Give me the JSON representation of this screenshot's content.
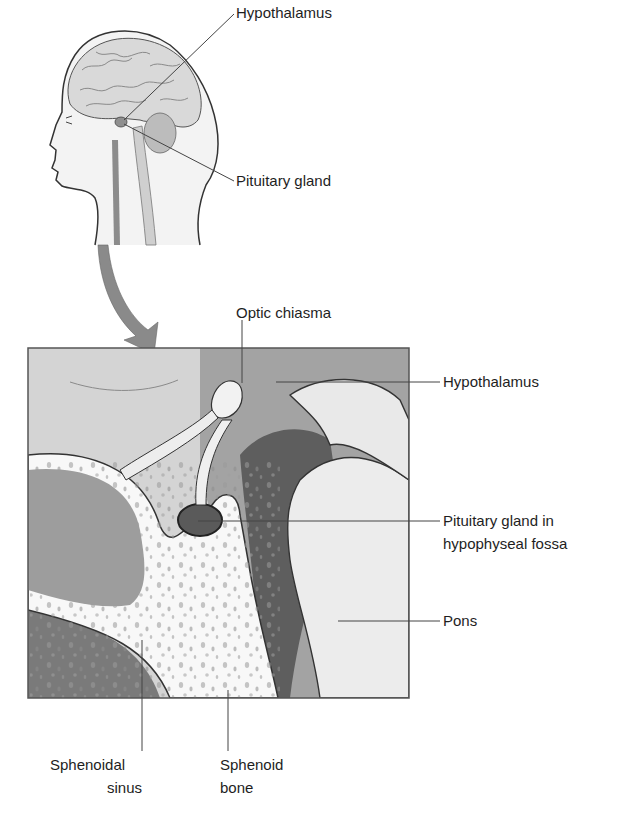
{
  "figure": {
    "type": "anatomical-diagram",
    "colors": {
      "background": "#ffffff",
      "skin": "#f1f1f1",
      "brain": "#d9d9d9",
      "outline": "#333333",
      "box_light": "#d2d2d2",
      "box_mid": "#9c9c9c",
      "box_dark": "#6e6e6e",
      "bone": "#f7f7f7",
      "arrow": "#8a8a8a",
      "leader_line": "#444444"
    }
  },
  "head_view": {
    "labels": {
      "hypothalamus": "Hypothalamus",
      "pituitary_gland": "Pituitary gland"
    }
  },
  "detail_view": {
    "labels": {
      "optic_chiasma": "Optic chiasma",
      "hypothalamus": "Hypothalamus",
      "pituitary_in_fossa_line1": "Pituitary gland in",
      "pituitary_in_fossa_line2": "hypophyseal fossa",
      "pons": "Pons",
      "sphenoidal_sinus_line1": "Sphenoidal",
      "sphenoidal_sinus_line2": "sinus",
      "sphenoid_bone_line1": "Sphenoid",
      "sphenoid_bone_line2": "bone"
    }
  }
}
